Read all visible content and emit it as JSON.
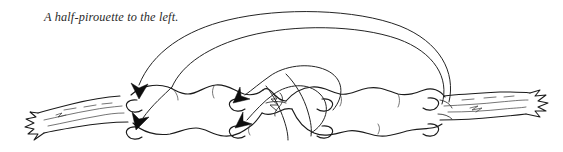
{
  "figure": {
    "kind": "pen-and-ink naturalist line drawing",
    "caption": "A half-pirouette to the left.",
    "background_color": "#ffffff",
    "ink_color": "#1a1a1a",
    "caption_color": "#2a2a2a",
    "width": 563,
    "height": 152
  },
  "annotations": {
    "motion_arrows": [
      {
        "name": "outer-sweep-arrow",
        "description": "large outer arc sweeping right-to-left over the body, ending in a downward arrowhead at the caterpillar's left end",
        "arrowhead_at": "left",
        "direction": "right-to-left"
      },
      {
        "name": "second-sweep-arrow",
        "description": "second large arc nested inside the outer one, ending in a lower downward arrowhead at the left end",
        "arrowhead_at": "left",
        "direction": "right-to-left"
      },
      {
        "name": "inner-upper-arrow",
        "description": "shorter inner arc from the mid-body hump curving left into a downward arrowhead",
        "arrowhead_at": "center-upper",
        "direction": "right-to-left"
      },
      {
        "name": "inner-lower-arrow",
        "description": "shorter inner arc looping beneath, ending in a downward arrowhead below the mid-body",
        "arrowhead_at": "center-lower",
        "direction": "right-to-left"
      }
    ],
    "arrowhead_count": 4,
    "sweep_arc_count": 4
  },
  "subject_parts": {
    "body_segments": 7,
    "prolegs_visible": 8,
    "waist": "pinched twist at mid-body where the larva rotates",
    "twig_left_end": "frayed, splintered twig tip at lower left",
    "twig_right_end": "frayed, splintered twig tip at lower right"
  }
}
